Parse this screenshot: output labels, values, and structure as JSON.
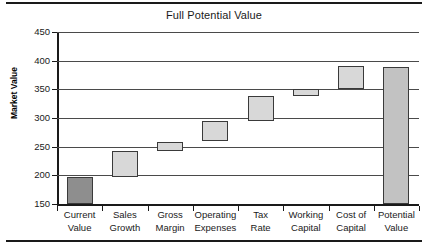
{
  "chart_data": {
    "type": "bar",
    "subtype": "waterfall",
    "title": "Full Potential Value",
    "xlabel": "",
    "ylabel": "Market Value",
    "ylim": [
      150,
      450
    ],
    "ytick_step": 50,
    "yticks": [
      150,
      200,
      250,
      300,
      350,
      400,
      450
    ],
    "ytick_labels": [
      "150",
      "200",
      "250",
      "300",
      "350",
      "400",
      "450"
    ],
    "grid": true,
    "legend": "none",
    "categories": [
      "Current Value",
      "Sales Growth",
      "Gross Margin",
      "Operating Expenses",
      "Tax Rate",
      "Working Capital",
      "Cost of Capital",
      "Potential Value"
    ],
    "category_lines": [
      [
        "Current",
        "Value"
      ],
      [
        "Sales",
        "Growth"
      ],
      [
        "Gross",
        "Margin"
      ],
      [
        "Operating",
        "Expenses"
      ],
      [
        "Tax",
        "Rate"
      ],
      [
        "Working",
        "Capital"
      ],
      [
        "Cost of",
        "Capital"
      ],
      [
        "Potential",
        "Value"
      ]
    ],
    "bars": [
      {
        "label": "Current Value",
        "base": 150,
        "top": 197,
        "delta": 47,
        "kind": "total",
        "color": "#8e8e8e"
      },
      {
        "label": "Sales Growth",
        "base": 197,
        "top": 243,
        "delta": 46,
        "kind": "increment",
        "color": "#d8d8d8"
      },
      {
        "label": "Gross Margin",
        "base": 243,
        "top": 259,
        "delta": 16,
        "kind": "increment",
        "color": "#d8d8d8"
      },
      {
        "label": "Operating Expenses",
        "base": 259,
        "top": 295,
        "delta": 36,
        "kind": "increment",
        "color": "#d8d8d8"
      },
      {
        "label": "Tax Rate",
        "base": 295,
        "top": 338,
        "delta": 43,
        "kind": "increment",
        "color": "#d8d8d8"
      },
      {
        "label": "Working Capital",
        "base": 338,
        "top": 350,
        "delta": 12,
        "kind": "increment",
        "color": "#d8d8d8"
      },
      {
        "label": "Cost of Capital",
        "base": 350,
        "top": 390,
        "delta": 40,
        "kind": "increment",
        "color": "#d8d8d8"
      },
      {
        "label": "Potential Value",
        "base": 150,
        "top": 389,
        "delta": 239,
        "kind": "total",
        "color": "#c2c2c2"
      }
    ],
    "values": [
      197,
      243,
      259,
      295,
      338,
      350,
      390,
      389
    ],
    "colors": {
      "axis": "#1a1a1a",
      "gridline": "#4a4a4a",
      "bar_increment": "#d8d8d8",
      "bar_current": "#8e8e8e",
      "bar_potential": "#c2c2c2",
      "bar_edge": "#3a3a3a",
      "background": "#ffffff",
      "text": "#1a1a1a"
    }
  }
}
